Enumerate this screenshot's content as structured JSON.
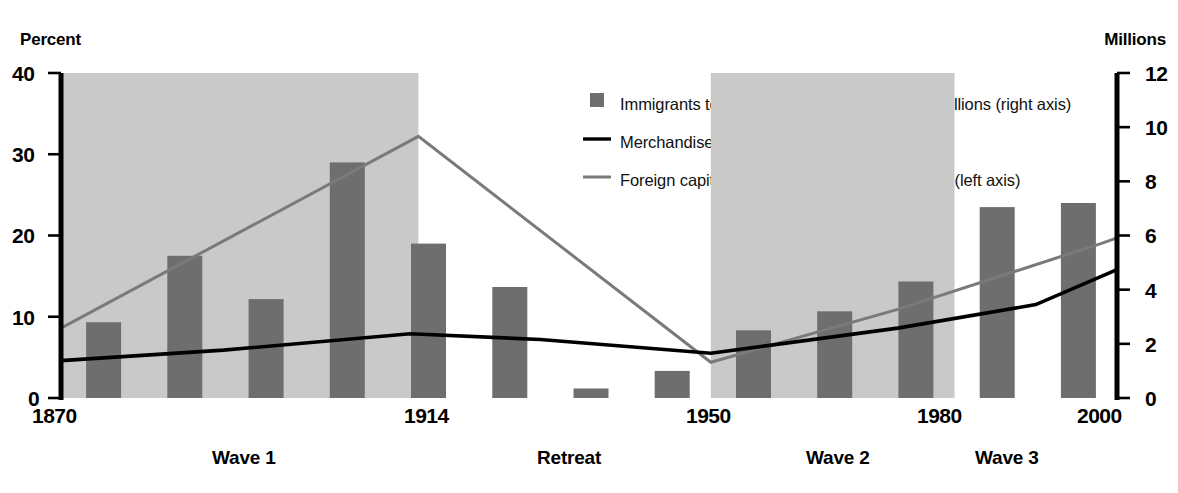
{
  "chart_data": {
    "type": "bar",
    "title": "",
    "subtitle": "",
    "left_axis_title": "Percent",
    "right_axis_title": "Millions",
    "xlabel": "",
    "ylabel": "Percent",
    "y2label": "Millions",
    "ylim": [
      0,
      40
    ],
    "y2lim": [
      0,
      12
    ],
    "grid": false,
    "legend_position": "top-right",
    "left_ticks": [
      "0",
      "10",
      "20",
      "30",
      "40"
    ],
    "left_tick_values": [
      0,
      10,
      20,
      30,
      40
    ],
    "right_ticks": [
      "0",
      "2",
      "4",
      "6",
      "8",
      "10",
      "12"
    ],
    "right_tick_values": [
      0,
      2,
      4,
      6,
      8,
      10,
      12
    ],
    "x_ticks": [
      "1870",
      "1914",
      "1950",
      "1980",
      "2000"
    ],
    "x_tick_values": [
      1870,
      1914,
      1950,
      1980,
      2000
    ],
    "xlim": [
      1870,
      2000
    ],
    "categories": [
      "1870s",
      "1880s",
      "1890s",
      "1900s",
      "1910s",
      "1920s",
      "1930s",
      "1940s",
      "1950s",
      "1960s",
      "1970s",
      "1980s",
      "1990s"
    ],
    "series": [
      {
        "name": "Immigrants to the United States by decade, millions (right axis)",
        "type": "bar",
        "axis": "right",
        "color": "#6e6e6e",
        "values": [
          2.8,
          5.25,
          3.65,
          8.7,
          5.7,
          4.1,
          0.35,
          1.0,
          2.5,
          3.2,
          4.3,
          7.05,
          7.2
        ]
      },
      {
        "name": "Merchandise exports/world GDP (left axis)",
        "type": "line",
        "axis": "left",
        "color": "#000000",
        "x": [
          1870,
          1890,
          1913,
          1929,
          1950,
          1973,
          1990,
          2000
        ],
        "y": [
          4.6,
          5.9,
          7.9,
          7.2,
          5.5,
          8.6,
          11.5,
          15.8
        ]
      },
      {
        "name": "Foreign capital stock/developing country GDP  (left axis)",
        "type": "line",
        "axis": "left",
        "color": "#7a7a7a",
        "x": [
          1870,
          1914,
          1950,
          1973,
          1998,
          2000
        ],
        "y": [
          8.6,
          32.2,
          4.4,
          10.9,
          19.0,
          19.7
        ]
      }
    ],
    "shaded_regions": [
      {
        "label": "Wave 1",
        "from": 1870,
        "to": 1914,
        "color": "#c9c9c9"
      },
      {
        "label": "Wave 2",
        "from": 1950,
        "to": 1980,
        "color": "#c9c9c9"
      }
    ],
    "period_labels": [
      {
        "label": "Wave 1"
      },
      {
        "label": "Retreat"
      },
      {
        "label": "Wave 2"
      },
      {
        "label": "Wave 3"
      }
    ],
    "annotations": []
  },
  "legend": {
    "items": [
      {
        "label": "Immigrants to the United States by decade, millions (right axis)",
        "marker": "square",
        "color": "#6e6e6e"
      },
      {
        "label": "Merchandise exports/world GDP (left axis)",
        "marker": "line",
        "color": "#000000"
      },
      {
        "label": "Foreign capital stock/developing country GDP  (left axis)",
        "marker": "line",
        "color": "#7a7a7a"
      }
    ]
  },
  "axes": {
    "left_title": "Percent",
    "right_title": "Millions",
    "left_ticks": [
      "40",
      "30",
      "20",
      "10",
      "0"
    ],
    "right_ticks": [
      "12",
      "10",
      "8",
      "6",
      "4",
      "2",
      "0"
    ],
    "x_labels": [
      "1870",
      "1914",
      "1950",
      "1980",
      "2000"
    ]
  },
  "periods": {
    "wave1": "Wave 1",
    "retreat": "Retreat",
    "wave2": "Wave 2",
    "wave3": "Wave 3"
  },
  "colors": {
    "bar": "#6e6e6e",
    "band": "#c9c9c9",
    "line_black": "#000000",
    "line_gray": "#7a7a7a",
    "axis": "#000000"
  }
}
